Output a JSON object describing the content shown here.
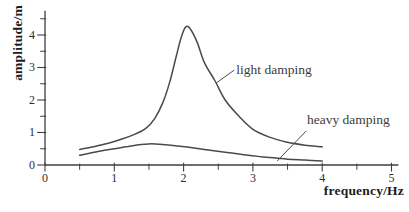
{
  "chart_data": {
    "type": "line",
    "title": "",
    "xlabel": "frequency/Hz",
    "ylabel": "amplitude/m",
    "xlim": [
      0,
      5.1
    ],
    "ylim": [
      0,
      4.75
    ],
    "grid": false,
    "legend_position": "inline-annotations",
    "x_major_ticks": [
      0,
      1,
      2,
      3,
      4,
      5
    ],
    "x_minor_ticks": [
      0.5,
      1.5,
      2.5,
      3.5,
      4.5
    ],
    "y_major_ticks": [
      0,
      1,
      2,
      3,
      4
    ],
    "y_minor_ticks": [
      0.5,
      1.5,
      2.5,
      3.5,
      4.5
    ],
    "series": [
      {
        "name": "light damping",
        "points": [
          [
            0.5,
            0.48
          ],
          [
            0.7,
            0.56
          ],
          [
            0.9,
            0.66
          ],
          [
            1.1,
            0.79
          ],
          [
            1.3,
            0.95
          ],
          [
            1.45,
            1.12
          ],
          [
            1.58,
            1.42
          ],
          [
            1.7,
            1.92
          ],
          [
            1.8,
            2.55
          ],
          [
            1.9,
            3.4
          ],
          [
            1.97,
            3.95
          ],
          [
            2.03,
            4.25
          ],
          [
            2.1,
            4.18
          ],
          [
            2.2,
            3.75
          ],
          [
            2.3,
            3.15
          ],
          [
            2.45,
            2.6
          ],
          [
            2.6,
            2.0
          ],
          [
            2.8,
            1.5
          ],
          [
            3.0,
            1.1
          ],
          [
            3.25,
            0.85
          ],
          [
            3.5,
            0.7
          ],
          [
            3.75,
            0.61
          ],
          [
            4.0,
            0.56
          ]
        ],
        "peak": {
          "x": 2.03,
          "y": 4.25
        }
      },
      {
        "name": "heavy damping",
        "points": [
          [
            0.5,
            0.3
          ],
          [
            0.75,
            0.41
          ],
          [
            1.0,
            0.5
          ],
          [
            1.2,
            0.57
          ],
          [
            1.35,
            0.62
          ],
          [
            1.5,
            0.65
          ],
          [
            1.65,
            0.64
          ],
          [
            1.85,
            0.6
          ],
          [
            2.05,
            0.55
          ],
          [
            2.3,
            0.48
          ],
          [
            2.6,
            0.39
          ],
          [
            2.9,
            0.31
          ],
          [
            3.2,
            0.24
          ],
          [
            3.5,
            0.18
          ],
          [
            3.75,
            0.15
          ],
          [
            4.0,
            0.12
          ]
        ],
        "peak": {
          "x": 1.5,
          "y": 0.65
        }
      }
    ],
    "annotations": [
      {
        "text": "light damping",
        "label_anchor": {
          "x": 2.76,
          "y": 3.17
        },
        "pointer_from": {
          "x": 2.73,
          "y": 2.92
        },
        "pointer_to": {
          "x": 2.47,
          "y": 2.52
        }
      },
      {
        "text": "heavy damping",
        "label_anchor": {
          "x": 3.78,
          "y": 1.63
        },
        "pointer_from": {
          "x": 3.77,
          "y": 1.05
        },
        "pointer_to": {
          "x": 3.35,
          "y": 0.12
        }
      }
    ]
  },
  "colors": {
    "curve": "#4a4a4a",
    "axis": "#3f3f3f",
    "tick": "#3f3f3f",
    "tick_label": "#2e2e2e",
    "axis_title": "#1b1b1b",
    "annotation_text": "#3c3c3c",
    "pointer_line": "#4a4a4a",
    "background": "#ffffff"
  }
}
